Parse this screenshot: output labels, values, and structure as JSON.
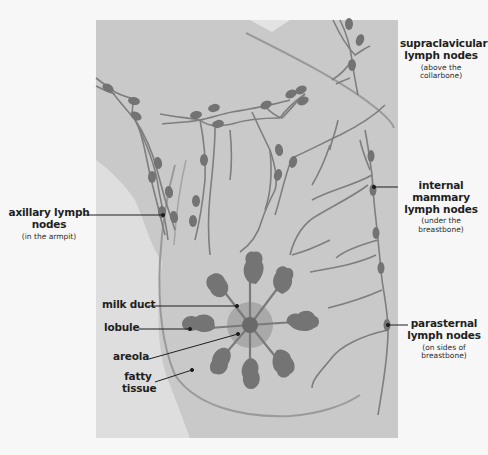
{
  "diagram": {
    "colors": {
      "background": "#f7f7f7",
      "panel": "#c9c9c9",
      "side_region": "#dedede",
      "wedge": "#e6e6e6",
      "vessel": "#7e7e7e",
      "node": "#737373",
      "lobule": "#747474",
      "areola": "#a9a9a9",
      "nipple": "#6a6a6a",
      "outline": "#9a9a9a",
      "leader": "#1f1f1f",
      "text": "#1f1f1f"
    }
  },
  "labels": {
    "supraclavicular": {
      "main": "supraclavicular lymph nodes",
      "sub": "(above the collarbone)"
    },
    "axillary": {
      "main": "axillary lymph nodes",
      "sub": "(in the armpit)"
    },
    "internal_mammary": {
      "main": "internal mammary lymph nodes",
      "sub": "(under the breastbone)"
    },
    "parasternal": {
      "main": "parasternal lymph nodes",
      "sub": "(on sides of breastbone)"
    },
    "milk_duct": {
      "main": "milk duct"
    },
    "lobule": {
      "main": "lobule"
    },
    "areola": {
      "main": "areola"
    },
    "fatty_tissue": {
      "main": "fatty tissue"
    }
  }
}
